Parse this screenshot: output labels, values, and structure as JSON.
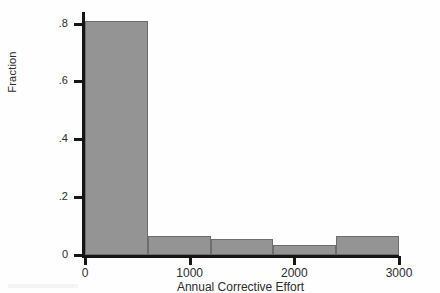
{
  "chart_data": {
    "type": "bar",
    "title": "",
    "subtitle": "",
    "xlabel": "Annual Corrective Effort",
    "ylabel": "Fraction",
    "xlim": [
      0,
      3000
    ],
    "ylim": [
      0,
      0.84
    ],
    "xticks": [
      0,
      1000,
      2000,
      3000
    ],
    "xtick_labels": [
      "0",
      "1000",
      "2000",
      "3000"
    ],
    "yticks": [
      0,
      0.2,
      0.4,
      0.6,
      0.8
    ],
    "ytick_labels": [
      "0",
      ".2",
      ".4",
      ".6",
      ".8"
    ],
    "grid": false,
    "legend": null,
    "bin_width": 600,
    "bin_edges": [
      0,
      600,
      1200,
      1800,
      2400,
      3000
    ],
    "categories": [
      "0-600",
      "600-1200",
      "1200-1800",
      "1800-2400",
      "2400-3000"
    ],
    "values": [
      0.81,
      0.065,
      0.055,
      0.035,
      0.065
    ],
    "bar_color": "#949494",
    "bar_edge_color": "#6d6d6d",
    "axis_color": "#151515",
    "background": "#fefefe"
  },
  "axes": {
    "ylabel": "Fraction",
    "xlabel": "Annual Corrective Effort"
  }
}
